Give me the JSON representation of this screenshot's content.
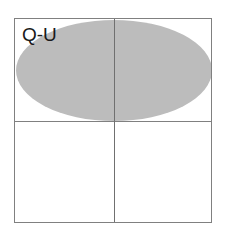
{
  "figure": {
    "label": "Q-U",
    "background_color": "#ffffff",
    "frame": {
      "border_color": "#808080",
      "fill_color": "#ffffff",
      "left": 14,
      "top": 18,
      "width": 198,
      "height": 205
    },
    "dividers": {
      "vertical": {
        "color": "#707070",
        "x": 99
      },
      "horizontal": {
        "color": "#808080",
        "y": 102
      }
    },
    "shaded_region": {
      "shape": "ellipse",
      "fill_color": "#bcbcbc",
      "left": 1,
      "top": 1,
      "width": 196,
      "height": 101
    },
    "label_position": {
      "left": 7,
      "top": 6
    }
  }
}
